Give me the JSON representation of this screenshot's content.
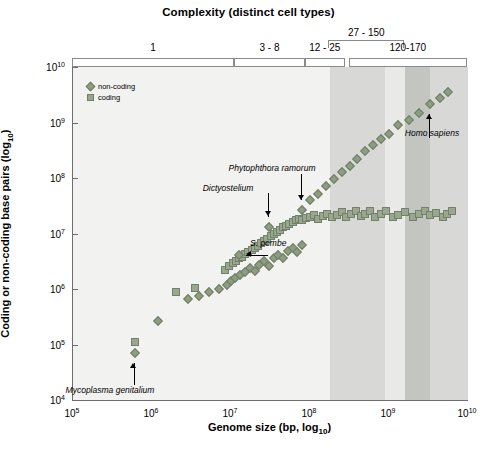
{
  "chart_data": {
    "type": "scatter",
    "title": "Complexity (distinct cell types)",
    "xlabel": "Genome size (bp, log10)",
    "ylabel": "Coding or non-coding base pairs (log10)",
    "xlim": [
      5,
      10
    ],
    "ylim": [
      4,
      10
    ],
    "xticks": [
      "10^5",
      "10^6",
      "10^7",
      "10^8",
      "10^9",
      "10^10"
    ],
    "yticks": [
      "10^4",
      "10^5",
      "10^6",
      "10^7",
      "10^8",
      "10^9",
      "10^10"
    ],
    "grid": false,
    "legend_position": "top-left",
    "legend": [
      {
        "name": "non-coding",
        "marker": "diamond",
        "color": "#8e9d82"
      },
      {
        "name": "coding",
        "marker": "square",
        "color": "#9aa78e"
      }
    ],
    "complexity_bands": [
      {
        "label": "1",
        "x_start": 5.0,
        "x_end": 7.05,
        "position": "lower"
      },
      {
        "label": "3 - 8",
        "x_start": 7.05,
        "x_end": 7.95,
        "position": "lower"
      },
      {
        "label": "12 - 25",
        "x_start": 7.95,
        "x_end": 8.45,
        "position": "lower"
      },
      {
        "label": "27 - 150",
        "x_start": 8.25,
        "x_end": 9.2,
        "position": "upper"
      },
      {
        "label": "120-170",
        "x_start": 8.5,
        "x_end": 10.0,
        "position": "lower"
      }
    ],
    "shaded_regions": [
      {
        "x_start": 5.0,
        "x_end": 8.25,
        "color": "#f2f2f0"
      },
      {
        "x_start": 8.25,
        "x_end": 8.95,
        "color": "#d8d9d6"
      },
      {
        "x_start": 8.95,
        "x_end": 9.2,
        "color": "#e9eae7"
      },
      {
        "x_start": 9.2,
        "x_end": 9.52,
        "color": "#c3c5c1"
      },
      {
        "x_start": 9.52,
        "x_end": 10.0,
        "color": "#d8d9d6"
      }
    ],
    "annotations": [
      {
        "text": "Mycoplasma genitalium",
        "arrow": "up",
        "target_x": 5.78,
        "target_y": 4.85
      },
      {
        "text": "S. pombe",
        "arrow": "left",
        "target_x": 7.1,
        "target_y": 6.62
      },
      {
        "text": "Dictyostelium",
        "arrow": "down",
        "target_x": 7.48,
        "target_y": 7.12
      },
      {
        "text": "Phytophthora ramorum",
        "arrow": "down",
        "target_x": 7.9,
        "target_y": 7.42
      },
      {
        "text": "Homo sapiens",
        "arrow": "up",
        "target_x": 9.52,
        "target_y": 9.33
      }
    ],
    "series": [
      {
        "name": "coding",
        "marker": "square",
        "points": [
          [
            5.78,
            5.05
          ],
          [
            6.3,
            5.95
          ],
          [
            6.55,
            6.02
          ],
          [
            6.92,
            6.34
          ],
          [
            6.98,
            6.41
          ],
          [
            7.02,
            6.46
          ],
          [
            7.06,
            6.5
          ],
          [
            7.1,
            6.55
          ],
          [
            7.14,
            6.58
          ],
          [
            7.18,
            6.63
          ],
          [
            7.22,
            6.66
          ],
          [
            7.26,
            6.7
          ],
          [
            7.3,
            6.74
          ],
          [
            7.34,
            6.78
          ],
          [
            7.38,
            6.82
          ],
          [
            7.42,
            6.86
          ],
          [
            7.46,
            6.9
          ],
          [
            7.5,
            6.95
          ],
          [
            7.54,
            6.99
          ],
          [
            7.58,
            7.02
          ],
          [
            7.62,
            7.07
          ],
          [
            7.66,
            7.11
          ],
          [
            7.7,
            7.14
          ],
          [
            7.74,
            7.18
          ],
          [
            7.78,
            7.2
          ],
          [
            7.82,
            7.24
          ],
          [
            7.86,
            7.26
          ],
          [
            7.9,
            7.24
          ],
          [
            7.95,
            7.28
          ],
          [
            8.0,
            7.3
          ],
          [
            8.05,
            7.33
          ],
          [
            8.1,
            7.27
          ],
          [
            8.16,
            7.32
          ],
          [
            8.22,
            7.36
          ],
          [
            8.28,
            7.3
          ],
          [
            8.34,
            7.34
          ],
          [
            8.4,
            7.38
          ],
          [
            8.46,
            7.3
          ],
          [
            8.52,
            7.35
          ],
          [
            8.58,
            7.4
          ],
          [
            8.64,
            7.32
          ],
          [
            8.7,
            7.36
          ],
          [
            8.76,
            7.41
          ],
          [
            8.82,
            7.3
          ],
          [
            8.9,
            7.35
          ],
          [
            8.96,
            7.4
          ],
          [
            9.05,
            7.3
          ],
          [
            9.12,
            7.34
          ],
          [
            9.2,
            7.38
          ],
          [
            9.3,
            7.3
          ],
          [
            9.38,
            7.35
          ],
          [
            9.46,
            7.4
          ],
          [
            9.52,
            7.33
          ],
          [
            9.6,
            7.37
          ],
          [
            9.68,
            7.3
          ],
          [
            9.74,
            7.36
          ],
          [
            9.8,
            7.4
          ]
        ]
      },
      {
        "name": "non-coding",
        "marker": "diamond",
        "points": [
          [
            5.78,
            4.85
          ],
          [
            6.08,
            5.42
          ],
          [
            6.45,
            5.82
          ],
          [
            6.6,
            5.88
          ],
          [
            6.72,
            5.95
          ],
          [
            6.85,
            6.0
          ],
          [
            6.95,
            6.08
          ],
          [
            7.0,
            6.14
          ],
          [
            7.05,
            6.2
          ],
          [
            7.12,
            6.26
          ],
          [
            7.18,
            6.3
          ],
          [
            7.24,
            6.38
          ],
          [
            7.3,
            6.32
          ],
          [
            7.36,
            6.44
          ],
          [
            7.42,
            6.5
          ],
          [
            7.48,
            6.42
          ],
          [
            7.54,
            6.56
          ],
          [
            7.6,
            6.62
          ],
          [
            7.66,
            6.55
          ],
          [
            7.72,
            6.68
          ],
          [
            7.78,
            6.74
          ],
          [
            7.84,
            6.66
          ],
          [
            7.9,
            6.8
          ],
          [
            7.1,
            6.62
          ],
          [
            7.48,
            7.12
          ],
          [
            7.9,
            7.42
          ],
          [
            8.0,
            7.6
          ],
          [
            8.1,
            7.72
          ],
          [
            8.2,
            7.85
          ],
          [
            8.3,
            7.98
          ],
          [
            8.4,
            8.1
          ],
          [
            8.5,
            8.22
          ],
          [
            8.6,
            8.35
          ],
          [
            8.7,
            8.48
          ],
          [
            8.8,
            8.6
          ],
          [
            8.9,
            8.7
          ],
          [
            9.0,
            8.8
          ],
          [
            9.12,
            8.95
          ],
          [
            9.25,
            9.05
          ],
          [
            9.38,
            9.18
          ],
          [
            9.52,
            9.33
          ],
          [
            9.65,
            9.45
          ],
          [
            9.75,
            9.55
          ]
        ]
      }
    ]
  }
}
